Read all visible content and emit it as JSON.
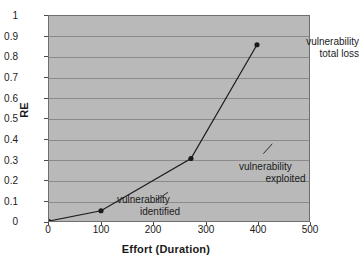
{
  "chart_data": {
    "type": "line",
    "title": "",
    "xlabel": "Effort (Duration)",
    "ylabel": "RE",
    "xlim": [
      0,
      500
    ],
    "ylim": [
      0,
      1
    ],
    "xticks": [
      "0",
      "100",
      "200",
      "300",
      "400",
      "500"
    ],
    "yticks": [
      "0",
      "0.1",
      "0.2",
      "0.3",
      "0.4",
      "0.5",
      "0.6",
      "0.7",
      "0.8",
      "0.9",
      "1"
    ],
    "grid": "horizontal",
    "legend": "none",
    "plot_background": "#b9b9b9",
    "line_color": "#1a1a1a",
    "marker_color": "#1a1a1a",
    "series": [
      {
        "name": "RE",
        "x": [
          0,
          100,
          273,
          400
        ],
        "values": [
          0,
          0.05,
          0.305,
          0.86
        ]
      }
    ],
    "annotations": [
      {
        "id": "identified",
        "line1": "vulnerability",
        "line2": "identified",
        "x": 100,
        "y": 0.05
      },
      {
        "id": "exploited",
        "line1": "vulnerability",
        "line2": "exploited",
        "x": 273,
        "y": 0.305
      },
      {
        "id": "total-loss",
        "line1": "vulnerability",
        "line2": "total loss",
        "x": 400,
        "y": 0.86
      }
    ]
  }
}
